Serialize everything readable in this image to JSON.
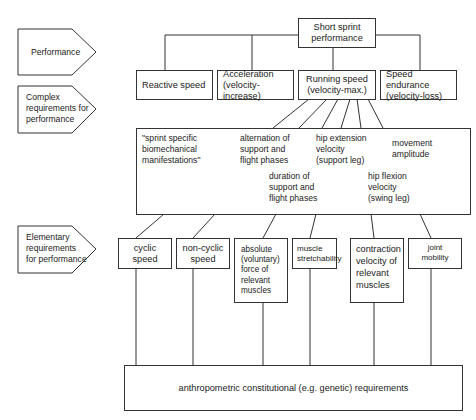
{
  "diagram": {
    "row_labels": [
      {
        "id": "performance",
        "text": "Performance"
      },
      {
        "id": "complex",
        "text": "Complex\nrequirements for\nperformance"
      },
      {
        "id": "elementary",
        "text": "Elementary\nrequirements\nfor performance"
      }
    ],
    "root": {
      "text": "Short sprint\nperformance"
    },
    "level2": [
      {
        "id": "reactive",
        "text": "Reactive speed"
      },
      {
        "id": "acceleration",
        "text": "Acceleration\n(velocity-increase)"
      },
      {
        "id": "running",
        "text": "Running speed\n(velocity-max.)"
      },
      {
        "id": "endurance",
        "text": "Speed endurance\n(velocity-loss)"
      }
    ],
    "complex_box": {
      "items": [
        {
          "id": "sprint-specific",
          "text": "\"sprint specific\nbiomechanical\nmanifestations\""
        },
        {
          "id": "alternation",
          "text": "alternation of\nsupport and\nflight phases"
        },
        {
          "id": "hip-extension",
          "text": "hip extension\nvelocity\n(support leg)"
        },
        {
          "id": "movement-amplitude",
          "text": "movement\namplitude"
        },
        {
          "id": "duration",
          "text": "duration of\nsupport and\nflight phases"
        },
        {
          "id": "hip-flexion",
          "text": "hip flexion\nvelocity\n(swing leg)"
        }
      ]
    },
    "elementary": [
      {
        "id": "cyclic",
        "text": "cyclic speed"
      },
      {
        "id": "non-cyclic",
        "text": "non-cyclic\nspeed"
      },
      {
        "id": "absolute-force",
        "text": "absolute\n(voluntary)\nforce of\nrelevant\nmuscles"
      },
      {
        "id": "stretchability",
        "text": "muscle\nstretchability"
      },
      {
        "id": "contraction",
        "text": "contraction\nvelocity of\nrelevant\nmuscles"
      },
      {
        "id": "joint",
        "text": "joint\nmobility"
      }
    ],
    "base": {
      "text": "anthropometric constitutional (e.g. genetic) requirements"
    }
  }
}
